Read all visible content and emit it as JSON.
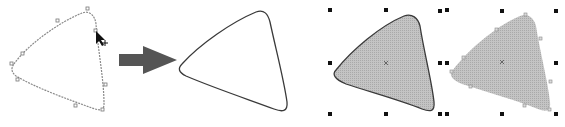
{
  "figure": {
    "colors": {
      "outline": "#3a3a3a",
      "node_outline": "#8a8a8a",
      "arrow": "#555555",
      "fill": "#b9b9b9",
      "handle": "#111111",
      "center_mark": "#666666",
      "background": "#ffffff"
    },
    "panels": [
      {
        "id": "node-edit",
        "label": "Shape with editable nodes and cursor"
      },
      {
        "id": "result-outline",
        "label": "Resulting rounded triangle outline"
      },
      {
        "id": "selected-filled-outlined",
        "label": "Selected shape with gray fill and outline"
      },
      {
        "id": "selected-filled",
        "label": "Selected shape with gray fill, no outline"
      }
    ],
    "icons": {
      "cursor": "arrow-pointer-icon",
      "move": "crosshair-plus-icon",
      "transition": "right-arrow-icon"
    }
  }
}
